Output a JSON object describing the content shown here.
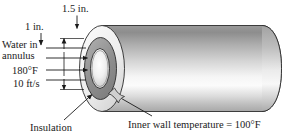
{
  "figure": {
    "background_color": "#ffffff",
    "line_color": "#1a1a1a"
  },
  "dimensions": {
    "outer_diameter_label": "1.5 in.",
    "inner_diameter_label": "1 in."
  },
  "flow_labels": {
    "line1": "Water in",
    "line2": "annulus",
    "temperature": "180°F",
    "velocity": "10 ft/s"
  },
  "callouts": {
    "insulation": "Insulation",
    "inner_wall": "Inner wall temperature = 100°F"
  },
  "colors": {
    "insulation_fill": "#e8e8e8",
    "annulus_fill": "#9a9a9a",
    "core_highlight": "#f2f2f2",
    "cylinder_dark": "#8d8d8d",
    "cylinder_light": "#fbfbfb"
  }
}
